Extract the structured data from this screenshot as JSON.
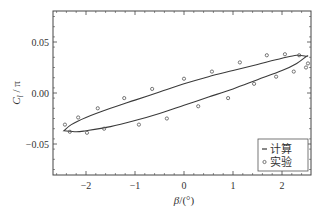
{
  "chart_data": {
    "type": "scatter",
    "title": "",
    "xlabel": "β/(°)",
    "ylabel": "C_l / π",
    "xlim": [
      -2.65,
      2.6
    ],
    "ylim": [
      -0.08,
      0.08
    ],
    "xticks": [
      -2,
      -1,
      0,
      1,
      2
    ],
    "xtick_labels": [
      "−2",
      "−1",
      "0",
      "1",
      "2"
    ],
    "yticks": [
      0.05,
      0.0,
      -0.05
    ],
    "ytick_labels": [
      "0.05",
      "0.00",
      "−0.05"
    ],
    "grid": false,
    "legend_position": "lower right",
    "series": [
      {
        "name": "计算",
        "style": "line",
        "branch_upper": {
          "x": [
            -2.45,
            -2.3,
            -2.0,
            -1.5,
            -1.0,
            -0.5,
            0.0,
            0.5,
            1.0,
            1.5,
            2.0,
            2.3,
            2.5
          ],
          "y": [
            -0.037,
            -0.031,
            -0.024,
            -0.015,
            -0.007,
            0.001,
            0.009,
            0.016,
            0.022,
            0.028,
            0.034,
            0.037,
            0.036
          ]
        },
        "branch_lower": {
          "x": [
            -2.45,
            -2.2,
            -2.0,
            -1.5,
            -1.0,
            -0.5,
            0.0,
            0.5,
            1.0,
            1.5,
            2.0,
            2.3,
            2.5
          ],
          "y": [
            -0.037,
            -0.038,
            -0.037,
            -0.033,
            -0.027,
            -0.02,
            -0.012,
            -0.004,
            0.004,
            0.013,
            0.022,
            0.029,
            0.036
          ]
        }
      },
      {
        "name": "实验",
        "style": "marker-open-circle",
        "x": [
          -2.43,
          -2.16,
          -1.76,
          -1.22,
          -0.65,
          0.0,
          0.57,
          1.14,
          1.69,
          2.06,
          2.35,
          -2.33,
          -1.98,
          -1.63,
          -0.92,
          -0.35,
          0.29,
          0.9,
          1.43,
          1.88,
          2.24,
          2.49,
          2.53
        ],
        "y": [
          -0.031,
          -0.024,
          -0.015,
          -0.005,
          0.004,
          0.014,
          0.021,
          0.03,
          0.037,
          0.038,
          0.037,
          -0.038,
          -0.039,
          -0.035,
          -0.031,
          -0.025,
          -0.013,
          -0.005,
          0.009,
          0.016,
          0.021,
          0.025,
          0.029
        ]
      }
    ]
  },
  "legend": {
    "items": [
      {
        "label": "计算",
        "symbol": "line"
      },
      {
        "label": "实验",
        "symbol": "circle"
      }
    ]
  },
  "axes": {
    "xlabel_beta": "β",
    "xlabel_unit": "/(°)",
    "ylabel_main": "C",
    "ylabel_sub": "l",
    "ylabel_tail": " / π"
  },
  "colors": {
    "line": "#3a3a3a",
    "marker": "#555555",
    "frame": "#444444",
    "text": "#333333"
  }
}
